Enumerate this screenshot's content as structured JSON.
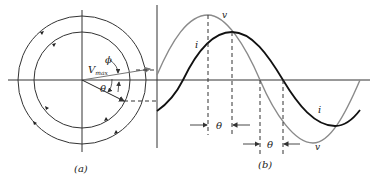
{
  "figure_a": {
    "caption": "(a)",
    "phasor_label": "V",
    "phasor_subscript": "max",
    "angle_phi": "ϕ",
    "angle_theta": "θ"
  },
  "figure_b": {
    "caption": "(b)",
    "voltage_label_top": "v",
    "voltage_label_bottom": "v",
    "current_label_top": "i",
    "current_label_bottom": "i",
    "phase_label_1": "θ",
    "phase_label_2": "θ"
  },
  "colors": {
    "voltage": "#8a8a8a",
    "current": "#111111",
    "axes": "#333333"
  }
}
